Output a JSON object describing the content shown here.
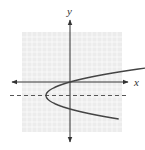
{
  "chart_data": {
    "type": "line",
    "title": "",
    "xlabel": "x",
    "ylabel": "y",
    "grid": true,
    "xlim": [
      -10,
      10
    ],
    "ylim": [
      -10,
      10
    ],
    "series": [
      {
        "name": "parabola (opens right, vertex left of origin)",
        "style": "solid",
        "equation_hint": "x = (y + 3)^2 / 1.8 - 5",
        "vertex": [
          -5,
          -3
        ],
        "points": [
          [
            10,
            2.2
          ],
          [
            5,
            1.2
          ],
          [
            0,
            0
          ],
          [
            -3,
            -1.1
          ],
          [
            -5,
            -3
          ],
          [
            -3,
            -4.9
          ],
          [
            0,
            -6
          ],
          [
            5,
            -7.2
          ],
          [
            10,
            -8.2
          ]
        ]
      },
      {
        "name": "axis of symmetry",
        "style": "dashed",
        "equation_hint": "y = -3",
        "points": [
          [
            -12,
            -3
          ],
          [
            12,
            -3
          ]
        ]
      }
    ]
  },
  "labels": {
    "x_axis": "x",
    "y_axis": "y"
  },
  "colors": {
    "grid_bg": "#eeeeee",
    "grid_line": "#ffffff",
    "axis": "#333333",
    "curve": "#444444",
    "dashed": "#555555"
  }
}
